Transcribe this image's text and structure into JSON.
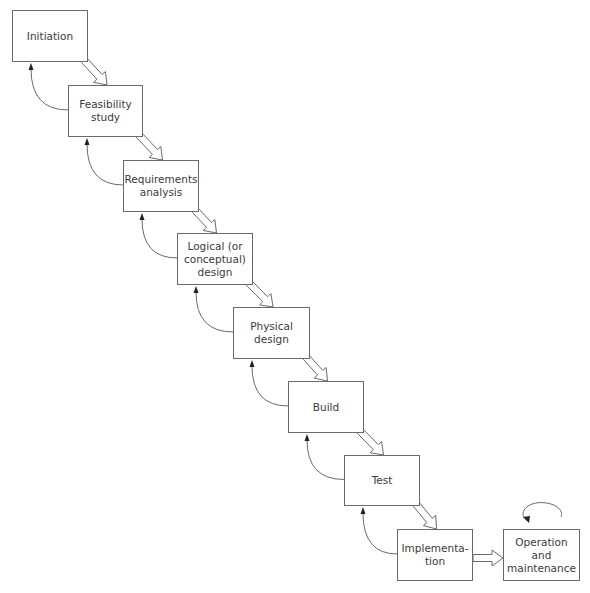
{
  "diagram": {
    "type": "waterfall-model",
    "stages": [
      {
        "id": "initiation",
        "label": "Initiation",
        "x": 12,
        "y": 10,
        "w": 76,
        "h": 52
      },
      {
        "id": "feasibility",
        "label": "Feasibility\nstudy",
        "x": 68,
        "y": 85,
        "w": 75,
        "h": 52
      },
      {
        "id": "requirements",
        "label": "Requirements\nanalysis",
        "x": 123,
        "y": 160,
        "w": 76,
        "h": 52
      },
      {
        "id": "logical-design",
        "label": "Logical (or\nconceptual)\ndesign",
        "x": 177,
        "y": 233,
        "w": 76,
        "h": 52
      },
      {
        "id": "physical-design",
        "label": "Physical\ndesign",
        "x": 233,
        "y": 307,
        "w": 77,
        "h": 52
      },
      {
        "id": "build",
        "label": "Build",
        "x": 288,
        "y": 381,
        "w": 76,
        "h": 52
      },
      {
        "id": "test",
        "label": "Test",
        "x": 344,
        "y": 455,
        "w": 76,
        "h": 51
      },
      {
        "id": "implementation",
        "label": "Implementa-\ntion",
        "x": 397,
        "y": 529,
        "w": 76,
        "h": 52
      },
      {
        "id": "operation",
        "label": "Operation and\nmaintenance",
        "x": 503,
        "y": 529,
        "w": 77,
        "h": 52
      }
    ],
    "connections": {
      "forward": "hollow block arrows from each stage to the next",
      "feedback": "curved thin arrows from each stage back to the previous stage",
      "loop": "circular arrow above Operation and maintenance"
    },
    "colors": {
      "stroke": "#6a6a6a",
      "text": "#3a3a3a",
      "background": "#ffffff"
    }
  }
}
